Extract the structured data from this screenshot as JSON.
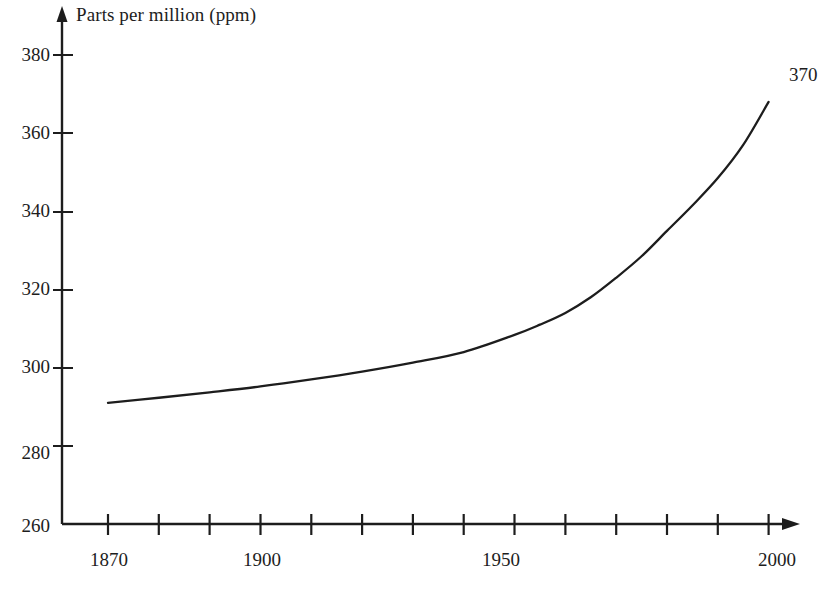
{
  "chart_data": {
    "type": "line",
    "title": "",
    "subtitle": "",
    "xlabel": "",
    "ylabel": "Parts per million (ppm)",
    "xlim": [
      1865,
      2005
    ],
    "ylim": [
      260,
      385
    ],
    "grid": false,
    "legend": "none",
    "x_ticks": [
      1870,
      1880,
      1890,
      1900,
      1910,
      1920,
      1930,
      1940,
      1950,
      1960,
      1970,
      1980,
      1990,
      2000
    ],
    "x_tick_labels": [
      "1870",
      "",
      "",
      "1900",
      "",
      "",
      "",
      "",
      "1950",
      "",
      "",
      "",
      "",
      "2000"
    ],
    "y_ticks": [
      260,
      280,
      300,
      320,
      340,
      360,
      380
    ],
    "y_tick_labels": [
      "260",
      "280",
      "300",
      "320",
      "340",
      "360",
      "380"
    ],
    "series": [
      {
        "name": "CO2 concentration",
        "color": "#1d1d1d",
        "x": [
          1870,
          1880,
          1890,
          1900,
          1910,
          1920,
          1930,
          1940,
          1950,
          1955,
          1960,
          1965,
          1970,
          1975,
          1980,
          1985,
          1990,
          1995,
          2000
        ],
        "values": [
          291.0,
          292.3,
          293.7,
          295.2,
          297.0,
          299.0,
          301.3,
          304.0,
          308.4,
          311.0,
          314.0,
          318.0,
          323.0,
          328.5,
          335.0,
          341.5,
          348.5,
          357.0,
          368.0
        ]
      }
    ],
    "annotations": [
      {
        "text": "370",
        "x": 2000,
        "y": 370,
        "position": "above-right"
      }
    ]
  },
  "axes": {
    "y_axis_title": "Parts per million (ppm)",
    "y_tick_labels": [
      "380",
      "360",
      "340",
      "320",
      "300",
      "280",
      "260"
    ],
    "x_tick_labels": [
      {
        "text": "1870",
        "year": 1870
      },
      {
        "text": "1900",
        "year": 1900
      },
      {
        "text": "1950",
        "year": 1950
      },
      {
        "text": "2000",
        "year": 2000
      }
    ]
  },
  "annotation": {
    "end_value": "370"
  }
}
